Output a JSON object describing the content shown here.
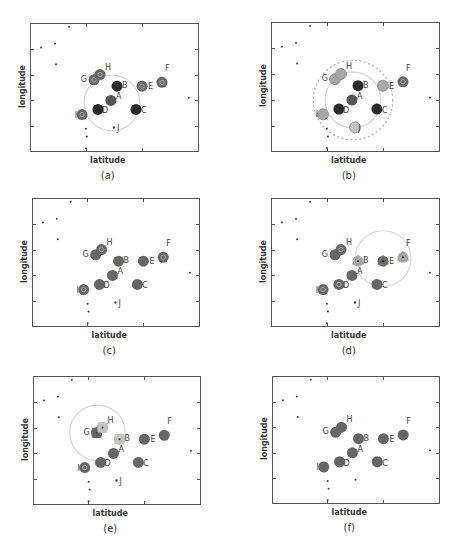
{
  "figure": {
    "panels": [
      {
        "id": "a",
        "caption": "(a)",
        "xlabel": "latitude",
        "ylabel": "longitude"
      },
      {
        "id": "b",
        "caption": "(b)",
        "xlabel": "latitude",
        "ylabel": "longitude"
      },
      {
        "id": "c",
        "caption": "(c)",
        "xlabel": "latitude",
        "ylabel": "longitude"
      },
      {
        "id": "d",
        "caption": "(d)",
        "xlabel": "latitude",
        "ylabel": "longitude"
      },
      {
        "id": "e",
        "caption": "(e)",
        "xlabel": "latitude",
        "ylabel": "longitude"
      },
      {
        "id": "f",
        "caption": "(f)",
        "xlabel": "latitude",
        "ylabel": "longitude"
      }
    ]
  },
  "colors": {
    "frame": "#555555",
    "node_dark": "#2a2a2a",
    "node_mid": "#555555",
    "node_gray": "#666666",
    "node_light": "#a8a8a8",
    "node_lighter": "#c4c4c4",
    "circle_solid": "#d8d8d8",
    "circle_dashed": "#b8b8b8",
    "label": "#444444",
    "dot": "#444444"
  },
  "chart_data": [
    {
      "type": "scatter",
      "panel": "a",
      "title": "(a)",
      "xlabel": "latitude",
      "ylabel": "longitude",
      "grid": false,
      "background_points": [
        [
          0.065,
          0.19
        ],
        [
          0.148,
          0.16
        ],
        [
          0.154,
          0.32
        ],
        [
          0.231,
          0.03
        ],
        [
          0.94,
          0.58
        ],
        [
          0.331,
          0.82
        ],
        [
          0.337,
          0.88
        ],
        [
          0.331,
          0.97
        ]
      ],
      "nodes": [
        {
          "label": "A",
          "x": 0.479,
          "y": 0.6,
          "style": "mid"
        },
        {
          "label": "B",
          "x": 0.515,
          "y": 0.49,
          "style": "dark"
        },
        {
          "label": "C",
          "x": 0.627,
          "y": 0.67,
          "style": "dark"
        },
        {
          "label": "D",
          "x": 0.402,
          "y": 0.67,
          "style": "dark"
        },
        {
          "label": "E",
          "x": 0.663,
          "y": 0.49,
          "style": "gray-ring"
        },
        {
          "label": "F",
          "x": 0.781,
          "y": 0.46,
          "style": "gray-ring"
        },
        {
          "label": "G",
          "x": 0.379,
          "y": 0.44,
          "style": "gray-ring"
        },
        {
          "label": "H",
          "x": 0.414,
          "y": 0.4,
          "style": "gray-ring"
        },
        {
          "label": "I",
          "x": 0.308,
          "y": 0.71,
          "style": "gray-ring"
        },
        {
          "label": "J",
          "x": 0.497,
          "y": 0.81,
          "style": "point"
        }
      ],
      "ranges": [
        {
          "cx": 0.485,
          "cy": 0.62,
          "r": 0.165,
          "style": "solid"
        }
      ]
    },
    {
      "type": "scatter",
      "panel": "b",
      "title": "(b)",
      "xlabel": "latitude",
      "ylabel": "longitude",
      "grid": false,
      "background_points": [
        [
          0.065,
          0.19
        ],
        [
          0.148,
          0.16
        ],
        [
          0.154,
          0.32
        ],
        [
          0.231,
          0.03
        ],
        [
          0.94,
          0.58
        ],
        [
          0.331,
          0.82
        ],
        [
          0.337,
          0.88
        ],
        [
          0.331,
          0.97
        ]
      ],
      "nodes": [
        {
          "label": "A",
          "x": 0.479,
          "y": 0.6,
          "style": "mid"
        },
        {
          "label": "B",
          "x": 0.515,
          "y": 0.49,
          "style": "dark"
        },
        {
          "label": "C",
          "x": 0.627,
          "y": 0.67,
          "style": "dark"
        },
        {
          "label": "D",
          "x": 0.402,
          "y": 0.67,
          "style": "dark"
        },
        {
          "label": "E",
          "x": 0.663,
          "y": 0.49,
          "style": "light"
        },
        {
          "label": "F",
          "x": 0.781,
          "y": 0.46,
          "style": "gray-ring"
        },
        {
          "label": "G",
          "x": 0.379,
          "y": 0.44,
          "style": "light"
        },
        {
          "label": "H",
          "x": 0.414,
          "y": 0.4,
          "style": "light"
        },
        {
          "label": "I",
          "x": 0.308,
          "y": 0.71,
          "style": "light"
        },
        {
          "label": "J",
          "x": 0.497,
          "y": 0.81,
          "style": "lighter"
        }
      ],
      "ranges": [
        {
          "cx": 0.485,
          "cy": 0.6,
          "r": 0.165,
          "style": "solid"
        },
        {
          "cx": 0.485,
          "cy": 0.6,
          "r": 0.235,
          "style": "dashed"
        }
      ]
    },
    {
      "type": "scatter",
      "panel": "c",
      "title": "(c)",
      "xlabel": "latitude",
      "ylabel": "longitude",
      "grid": false,
      "background_points": [
        [
          0.065,
          0.19
        ],
        [
          0.148,
          0.16
        ],
        [
          0.154,
          0.32
        ],
        [
          0.231,
          0.03
        ],
        [
          0.94,
          0.58
        ],
        [
          0.331,
          0.82
        ],
        [
          0.337,
          0.88
        ],
        [
          0.331,
          0.97
        ]
      ],
      "nodes": [
        {
          "label": "A",
          "x": 0.479,
          "y": 0.6,
          "style": "gray"
        },
        {
          "label": "B",
          "x": 0.515,
          "y": 0.49,
          "style": "gray"
        },
        {
          "label": "C",
          "x": 0.627,
          "y": 0.67,
          "style": "gray"
        },
        {
          "label": "D",
          "x": 0.402,
          "y": 0.67,
          "style": "gray"
        },
        {
          "label": "E",
          "x": 0.663,
          "y": 0.49,
          "style": "gray"
        },
        {
          "label": "F",
          "x": 0.781,
          "y": 0.46,
          "style": "gray-ring"
        },
        {
          "label": "G",
          "x": 0.379,
          "y": 0.44,
          "style": "gray"
        },
        {
          "label": "H",
          "x": 0.414,
          "y": 0.4,
          "style": "gray-ring"
        },
        {
          "label": "I",
          "x": 0.308,
          "y": 0.71,
          "style": "gray-ring"
        },
        {
          "label": "J",
          "x": 0.497,
          "y": 0.81,
          "style": "point"
        }
      ],
      "ranges": []
    },
    {
      "type": "scatter",
      "panel": "d",
      "title": "(d)",
      "xlabel": "latitude",
      "ylabel": "longitude",
      "grid": false,
      "background_points": [
        [
          0.065,
          0.19
        ],
        [
          0.148,
          0.16
        ],
        [
          0.154,
          0.32
        ],
        [
          0.231,
          0.03
        ],
        [
          0.94,
          0.58
        ],
        [
          0.331,
          0.82
        ],
        [
          0.337,
          0.88
        ],
        [
          0.331,
          0.97
        ]
      ],
      "nodes": [
        {
          "label": "A",
          "x": 0.479,
          "y": 0.6,
          "style": "gray"
        },
        {
          "label": "B",
          "x": 0.515,
          "y": 0.49,
          "style": "tri-light"
        },
        {
          "label": "C",
          "x": 0.627,
          "y": 0.67,
          "style": "gray"
        },
        {
          "label": "D",
          "x": 0.402,
          "y": 0.67,
          "style": "gray-ring"
        },
        {
          "label": "E",
          "x": 0.663,
          "y": 0.49,
          "style": "tri-dark"
        },
        {
          "label": "F",
          "x": 0.781,
          "y": 0.46,
          "style": "tri-light"
        },
        {
          "label": "G",
          "x": 0.379,
          "y": 0.44,
          "style": "gray"
        },
        {
          "label": "H",
          "x": 0.414,
          "y": 0.4,
          "style": "gray-ring"
        },
        {
          "label": "I",
          "x": 0.308,
          "y": 0.71,
          "style": "gray-ring"
        },
        {
          "label": "J",
          "x": 0.497,
          "y": 0.81,
          "style": "point"
        }
      ],
      "ranges": [
        {
          "cx": 0.663,
          "cy": 0.47,
          "r": 0.165,
          "style": "solid"
        }
      ]
    },
    {
      "type": "scatter",
      "panel": "e",
      "title": "(e)",
      "xlabel": "latitude",
      "ylabel": "longitude",
      "grid": false,
      "background_points": [
        [
          0.065,
          0.19
        ],
        [
          0.148,
          0.16
        ],
        [
          0.154,
          0.32
        ],
        [
          0.231,
          0.03
        ],
        [
          0.94,
          0.58
        ],
        [
          0.331,
          0.82
        ],
        [
          0.337,
          0.88
        ],
        [
          0.331,
          0.97
        ]
      ],
      "nodes": [
        {
          "label": "A",
          "x": 0.479,
          "y": 0.6,
          "style": "gray"
        },
        {
          "label": "B",
          "x": 0.515,
          "y": 0.49,
          "style": "sq-light"
        },
        {
          "label": "C",
          "x": 0.627,
          "y": 0.67,
          "style": "gray"
        },
        {
          "label": "D",
          "x": 0.402,
          "y": 0.67,
          "style": "gray"
        },
        {
          "label": "E",
          "x": 0.663,
          "y": 0.49,
          "style": "gray"
        },
        {
          "label": "F",
          "x": 0.781,
          "y": 0.46,
          "style": "gray"
        },
        {
          "label": "G",
          "x": 0.379,
          "y": 0.44,
          "style": "sq-dark"
        },
        {
          "label": "H",
          "x": 0.414,
          "y": 0.4,
          "style": "sq-light"
        },
        {
          "label": "I",
          "x": 0.308,
          "y": 0.71,
          "style": "gray-ring"
        },
        {
          "label": "J",
          "x": 0.497,
          "y": 0.81,
          "style": "point"
        }
      ],
      "ranges": [
        {
          "cx": 0.384,
          "cy": 0.44,
          "r": 0.165,
          "style": "solid"
        }
      ]
    },
    {
      "type": "scatter",
      "panel": "f",
      "title": "(f)",
      "xlabel": "latitude",
      "ylabel": "longitude",
      "grid": false,
      "background_points": [
        [
          0.065,
          0.19
        ],
        [
          0.148,
          0.16
        ],
        [
          0.154,
          0.32
        ],
        [
          0.231,
          0.03
        ],
        [
          0.94,
          0.58
        ],
        [
          0.331,
          0.82
        ],
        [
          0.337,
          0.88
        ],
        [
          0.331,
          0.97
        ],
        [
          0.497,
          0.81
        ]
      ],
      "nodes": [
        {
          "label": "A",
          "x": 0.479,
          "y": 0.6,
          "style": "gray"
        },
        {
          "label": "B",
          "x": 0.515,
          "y": 0.49,
          "style": "gray"
        },
        {
          "label": "C",
          "x": 0.627,
          "y": 0.67,
          "style": "gray"
        },
        {
          "label": "D",
          "x": 0.402,
          "y": 0.67,
          "style": "gray"
        },
        {
          "label": "E",
          "x": 0.663,
          "y": 0.49,
          "style": "gray"
        },
        {
          "label": "F",
          "x": 0.781,
          "y": 0.46,
          "style": "gray"
        },
        {
          "label": "G",
          "x": 0.379,
          "y": 0.44,
          "style": "gray"
        },
        {
          "label": "H",
          "x": 0.414,
          "y": 0.4,
          "style": "gray"
        },
        {
          "label": "I",
          "x": 0.308,
          "y": 0.71,
          "style": "gray"
        }
      ],
      "ranges": []
    }
  ]
}
